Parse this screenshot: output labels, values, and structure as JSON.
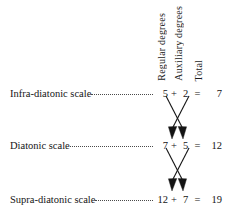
{
  "figure": {
    "headers": [
      {
        "id": "regular",
        "label": "Regular degrees"
      },
      {
        "id": "auxiliary",
        "label": "Auxiliary degrees"
      },
      {
        "id": "total",
        "label": "Total"
      }
    ],
    "rows": [
      {
        "id": "infra-diatonic",
        "label": "Infra-diatonic scale",
        "regular": "5",
        "plus": "+",
        "auxiliary": "2",
        "equals": "=",
        "total": "7"
      },
      {
        "id": "diatonic",
        "label": "Diatonic scale",
        "regular": "7",
        "plus": "+",
        "auxiliary": "5",
        "equals": "=",
        "total": "12"
      },
      {
        "id": "supra-diatonic",
        "label": "Supra-diatonic scale",
        "regular": "12",
        "plus": "+",
        "auxiliary": "7",
        "equals": "=",
        "total": "19"
      }
    ],
    "connectors": [
      {
        "id": "cross-infra-to-diatonic",
        "icon": "crossed-arrows-icon"
      },
      {
        "id": "cross-diatonic-to-supra",
        "icon": "crossed-arrows-icon"
      }
    ],
    "ink_color": "#141414",
    "leader_color": "#4a4a4a",
    "background_color": "#ffffff"
  }
}
